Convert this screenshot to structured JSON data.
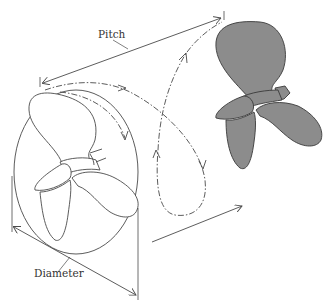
{
  "diagram": {
    "labels": {
      "pitch": "Pitch",
      "diameter": "Diameter"
    },
    "colors": {
      "background": "#ffffff",
      "line": "#4a4a4a",
      "propeller_fill_front": "#ffffff",
      "propeller_fill_advanced": "#8c8c8c"
    },
    "elements": [
      {
        "name": "propeller-outline",
        "description": "Three-blade propeller drawn in outline inside its swept circle"
      },
      {
        "name": "propeller-shaded",
        "description": "Same propeller after one revolution, shaded grey, advanced forward"
      },
      {
        "name": "helical-path",
        "description": "Dashed helical path traced by blade tip with direction arrows"
      },
      {
        "name": "pitch-dimension",
        "description": "Double-headed arrow showing distance advanced in one revolution"
      },
      {
        "name": "diameter-dimension",
        "description": "Double-headed arrow spanning swept circle"
      },
      {
        "name": "direction-arrow",
        "description": "Arrow showing direction of travel"
      }
    ]
  }
}
